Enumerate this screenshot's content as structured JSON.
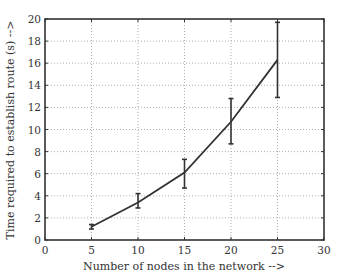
{
  "chart_data": {
    "type": "line",
    "title": "",
    "xlabel": "Number of nodes in the network -->",
    "ylabel": "Time required to establish route (s) -->",
    "xlim": [
      0,
      30
    ],
    "ylim": [
      0,
      20
    ],
    "xticks": [
      0,
      5,
      10,
      15,
      20,
      25,
      30
    ],
    "yticks": [
      0,
      2,
      4,
      6,
      8,
      10,
      12,
      14,
      16,
      18,
      20
    ],
    "grid": true,
    "grid_style": "dotted",
    "legend": null,
    "series": [
      {
        "name": "Route establishment time",
        "x": [
          5,
          10,
          15,
          20,
          25
        ],
        "y": [
          1.2,
          3.4,
          6.1,
          10.7,
          16.3
        ],
        "error_low": [
          1.0,
          2.9,
          4.7,
          8.7,
          12.9
        ],
        "error_high": [
          1.4,
          4.2,
          7.3,
          12.8,
          19.7
        ],
        "color": "#333333"
      }
    ]
  },
  "colors": {
    "line": "#333333",
    "axis": "#333333",
    "grid": "#999999",
    "background": "#ffffff"
  }
}
